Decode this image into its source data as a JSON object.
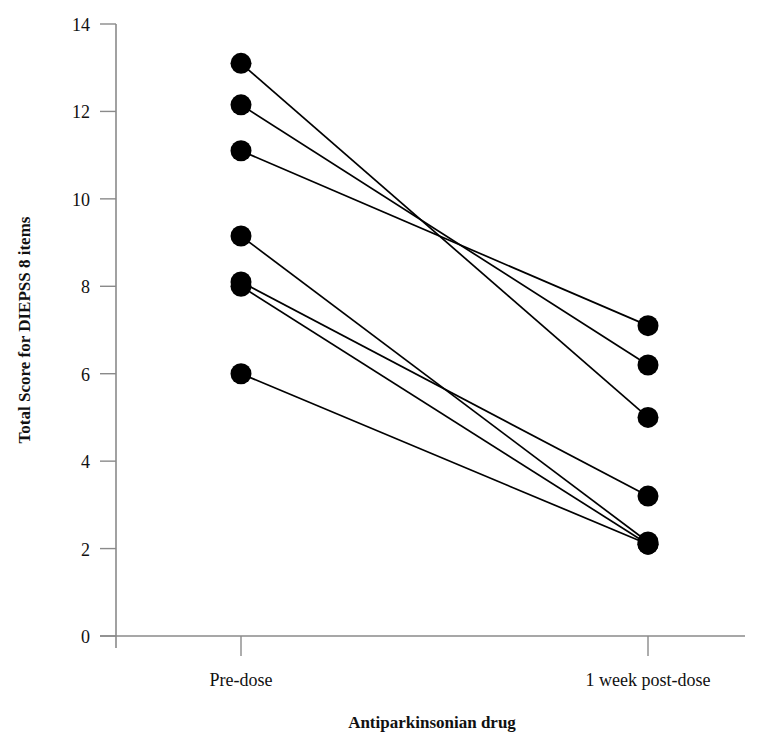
{
  "chart_data": {
    "type": "line",
    "title": "",
    "subtitle": "",
    "xlabel": "Antiparkinsonian drug",
    "ylabel": "Total Score for DIEPSS 8 items",
    "categories": [
      "Pre-dose",
      "1 week post-dose"
    ],
    "x": [
      0,
      1
    ],
    "xtick_labels": [
      "Pre-dose",
      "1 week post-dose"
    ],
    "ytick_labels": [
      "0",
      "2",
      "4",
      "6",
      "8",
      "10",
      "12",
      "14"
    ],
    "yticks": [
      0,
      2,
      4,
      6,
      8,
      10,
      12,
      14
    ],
    "ylim": [
      0,
      14.2
    ],
    "xlim": [
      -0.45,
      1.45
    ],
    "grid": false,
    "legend": false,
    "legend_position": "none",
    "marker": "filled-circle",
    "marker_color": "#000000",
    "line_color": "#000000",
    "axis_color": "#808080",
    "series": [
      {
        "name": "subject-1",
        "values": [
          13.1,
          5.0
        ]
      },
      {
        "name": "subject-2",
        "values": [
          12.15,
          6.2
        ]
      },
      {
        "name": "subject-3",
        "values": [
          11.1,
          7.1
        ]
      },
      {
        "name": "subject-4",
        "values": [
          9.15,
          2.15
        ]
      },
      {
        "name": "subject-5",
        "values": [
          8.1,
          3.2
        ]
      },
      {
        "name": "subject-6",
        "values": [
          8.0,
          2.1
        ]
      },
      {
        "name": "subject-7",
        "values": [
          6.0,
          2.1
        ]
      }
    ]
  }
}
